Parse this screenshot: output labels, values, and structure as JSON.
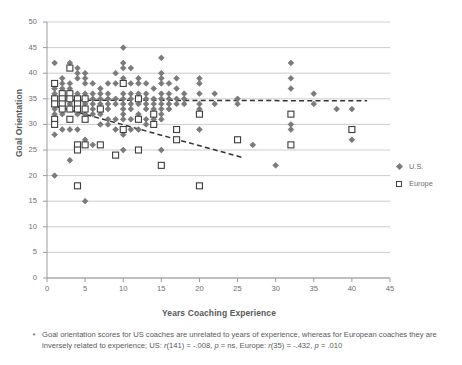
{
  "chart_data": {
    "type": "scatter",
    "title": "",
    "xlabel": "Years Coaching Experience",
    "ylabel": "Goal Orientation",
    "xlim": [
      0,
      45
    ],
    "ylim": [
      0,
      50
    ],
    "xticks": [
      0,
      5,
      10,
      15,
      20,
      25,
      30,
      35,
      40,
      45
    ],
    "yticks": [
      0,
      5,
      10,
      15,
      20,
      25,
      30,
      35,
      40,
      45,
      50
    ],
    "grid": "horizontal",
    "legend_position": "right",
    "series": [
      {
        "name": "U.S.",
        "marker": "diamond",
        "color": "#7b7b7b",
        "n": 143,
        "points": [
          [
            1,
            42
          ],
          [
            1,
            38
          ],
          [
            1,
            37
          ],
          [
            1,
            36
          ],
          [
            1,
            35
          ],
          [
            1,
            34
          ],
          [
            1,
            33
          ],
          [
            1,
            32
          ],
          [
            1,
            30
          ],
          [
            1,
            28
          ],
          [
            1,
            20
          ],
          [
            2,
            39
          ],
          [
            2,
            38
          ],
          [
            2,
            37
          ],
          [
            2,
            36
          ],
          [
            2,
            35
          ],
          [
            2,
            34
          ],
          [
            2,
            33
          ],
          [
            2,
            32
          ],
          [
            2,
            29
          ],
          [
            3,
            42
          ],
          [
            3,
            38
          ],
          [
            3,
            37
          ],
          [
            3,
            36
          ],
          [
            3,
            35
          ],
          [
            3,
            34
          ],
          [
            3,
            33
          ],
          [
            3,
            31
          ],
          [
            3,
            29
          ],
          [
            3,
            23
          ],
          [
            4,
            41
          ],
          [
            4,
            40
          ],
          [
            4,
            39
          ],
          [
            4,
            36
          ],
          [
            4,
            35
          ],
          [
            4,
            34
          ],
          [
            4,
            33
          ],
          [
            4,
            32
          ],
          [
            4,
            29
          ],
          [
            5,
            40
          ],
          [
            5,
            39
          ],
          [
            5,
            38
          ],
          [
            5,
            36
          ],
          [
            5,
            35
          ],
          [
            5,
            34
          ],
          [
            5,
            33
          ],
          [
            5,
            32
          ],
          [
            5,
            27
          ],
          [
            5,
            15
          ],
          [
            6,
            38
          ],
          [
            6,
            36
          ],
          [
            6,
            35
          ],
          [
            6,
            34
          ],
          [
            6,
            33
          ],
          [
            6,
            32
          ],
          [
            6,
            26
          ],
          [
            7,
            37
          ],
          [
            7,
            36
          ],
          [
            7,
            35
          ],
          [
            7,
            34
          ],
          [
            7,
            32
          ],
          [
            7,
            30
          ],
          [
            8,
            38
          ],
          [
            8,
            36
          ],
          [
            8,
            35
          ],
          [
            8,
            34
          ],
          [
            8,
            33
          ],
          [
            8,
            31
          ],
          [
            8,
            30
          ],
          [
            9,
            40
          ],
          [
            9,
            38
          ],
          [
            9,
            35
          ],
          [
            9,
            34
          ],
          [
            9,
            31
          ],
          [
            9,
            29
          ],
          [
            10,
            45
          ],
          [
            10,
            42
          ],
          [
            10,
            41
          ],
          [
            10,
            39
          ],
          [
            10,
            38
          ],
          [
            10,
            36
          ],
          [
            10,
            35
          ],
          [
            10,
            34
          ],
          [
            10,
            33
          ],
          [
            10,
            32
          ],
          [
            10,
            31
          ],
          [
            10,
            29
          ],
          [
            10,
            28
          ],
          [
            10,
            25
          ],
          [
            11,
            41
          ],
          [
            11,
            38
          ],
          [
            11,
            36
          ],
          [
            11,
            35
          ],
          [
            11,
            34
          ],
          [
            11,
            33
          ],
          [
            11,
            31
          ],
          [
            11,
            29
          ],
          [
            12,
            39
          ],
          [
            12,
            38
          ],
          [
            12,
            36
          ],
          [
            12,
            35
          ],
          [
            12,
            34
          ],
          [
            12,
            32
          ],
          [
            12,
            31
          ],
          [
            12,
            29
          ],
          [
            12,
            25
          ],
          [
            13,
            38
          ],
          [
            13,
            36
          ],
          [
            13,
            35
          ],
          [
            13,
            34
          ],
          [
            13,
            33
          ],
          [
            13,
            31
          ],
          [
            13,
            30
          ],
          [
            14,
            37
          ],
          [
            14,
            35
          ],
          [
            14,
            34
          ],
          [
            14,
            33
          ],
          [
            14,
            32
          ],
          [
            14,
            31
          ],
          [
            15,
            43
          ],
          [
            15,
            40
          ],
          [
            15,
            39
          ],
          [
            15,
            38
          ],
          [
            15,
            36
          ],
          [
            15,
            35
          ],
          [
            15,
            34
          ],
          [
            15,
            33
          ],
          [
            15,
            32
          ],
          [
            15,
            31
          ],
          [
            15,
            25
          ],
          [
            16,
            38
          ],
          [
            16,
            36
          ],
          [
            16,
            35
          ],
          [
            16,
            34
          ],
          [
            16,
            33
          ],
          [
            17,
            39
          ],
          [
            17,
            37
          ],
          [
            17,
            35
          ],
          [
            17,
            34
          ],
          [
            18,
            36
          ],
          [
            18,
            35
          ],
          [
            18,
            34
          ],
          [
            20,
            39
          ],
          [
            20,
            38
          ],
          [
            20,
            36
          ],
          [
            20,
            34
          ],
          [
            20,
            33
          ],
          [
            20,
            29
          ],
          [
            22,
            36
          ],
          [
            22,
            34
          ],
          [
            25,
            35
          ],
          [
            25,
            34
          ],
          [
            27,
            26
          ],
          [
            30,
            22
          ],
          [
            32,
            42
          ],
          [
            32,
            39
          ],
          [
            32,
            37
          ],
          [
            32,
            32
          ],
          [
            32,
            30
          ],
          [
            32,
            29
          ],
          [
            35,
            36
          ],
          [
            35,
            34
          ],
          [
            38,
            33
          ],
          [
            40,
            33
          ],
          [
            40,
            27
          ]
        ]
      },
      {
        "name": "Europe",
        "marker": "square",
        "color": "#ffffff",
        "edge_color": "#3d3d3d",
        "n": 37,
        "points": [
          [
            1,
            38
          ],
          [
            1,
            35
          ],
          [
            1,
            34
          ],
          [
            1,
            31
          ],
          [
            1,
            30
          ],
          [
            2,
            36
          ],
          [
            2,
            35
          ],
          [
            2,
            34
          ],
          [
            2,
            33
          ],
          [
            3,
            41
          ],
          [
            3,
            36
          ],
          [
            3,
            35
          ],
          [
            3,
            33
          ],
          [
            3,
            31
          ],
          [
            4,
            35
          ],
          [
            4,
            34
          ],
          [
            4,
            33
          ],
          [
            4,
            26
          ],
          [
            4,
            25
          ],
          [
            4,
            18
          ],
          [
            5,
            35
          ],
          [
            5,
            33
          ],
          [
            5,
            31
          ],
          [
            5,
            26
          ],
          [
            7,
            33
          ],
          [
            7,
            26
          ],
          [
            9,
            24
          ],
          [
            10,
            38
          ],
          [
            10,
            29
          ],
          [
            12,
            35
          ],
          [
            12,
            31
          ],
          [
            12,
            25
          ],
          [
            14,
            32
          ],
          [
            14,
            30
          ],
          [
            15,
            22
          ],
          [
            17,
            29
          ],
          [
            17,
            27
          ],
          [
            20,
            32
          ],
          [
            20,
            18
          ],
          [
            25,
            27
          ],
          [
            32,
            32
          ],
          [
            32,
            26
          ],
          [
            40,
            29
          ]
        ]
      }
    ],
    "trendlines": [
      {
        "name": "US trendline",
        "style": "dashed",
        "color": "#333333",
        "x0": 0.8,
        "y0": 34.75,
        "x1": 42.0,
        "y1": 34.6
      },
      {
        "name": "Europe trendline",
        "style": "dashed",
        "color": "#333333",
        "x0": 1.0,
        "y0": 33.6,
        "x1": 25.5,
        "y1": 23.6
      }
    ]
  },
  "legend": {
    "items": [
      {
        "label": "U.S.",
        "marker": "diamond"
      },
      {
        "label": "Europe",
        "marker": "square"
      }
    ]
  },
  "caption": {
    "bullet": "*",
    "line1": "Goal orientation scores for US coaches are unrelated to years of experience, whereas for",
    "line2_a": "European coaches they are inversely related to experience; US: ",
    "line2_r": "r",
    "line2_b": "(141) = -.008, ",
    "line2_p": "p",
    "line2_c": " = ns,",
    "line3_a": "Europe: ",
    "line3_r": "r",
    "line3_b": "(35) = -.432, ",
    "line3_p": "p",
    "line3_c": " = .010"
  }
}
